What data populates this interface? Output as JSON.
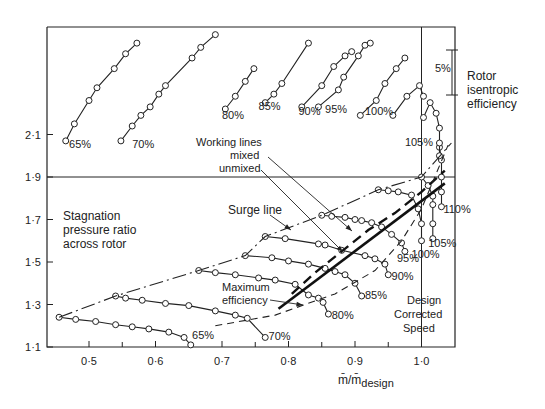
{
  "chart_data": {
    "type": "line",
    "title": "",
    "xlabel": "m̄/m̄design",
    "ylabel": "Stagnation pressure ratio across rotor",
    "secondary_ylabel": "Rotor isentropic efficiency",
    "efficiency_scale_label": "5%",
    "xlim": [
      0.44,
      1.055
    ],
    "ylim": [
      1.1,
      2.55
    ],
    "x_ticks": [
      0.5,
      0.6,
      0.7,
      0.8,
      0.9,
      1.0
    ],
    "x_tick_labels": [
      "0·5",
      "0·6",
      "0·7",
      "0·8",
      "0·9",
      "1·0"
    ],
    "y_ticks": [
      1.1,
      1.3,
      1.5,
      1.7,
      1.9,
      2.1
    ],
    "y_tick_labels": [
      "1·1",
      "1·3",
      "1·5",
      "1·7",
      "1·9",
      "2·1"
    ],
    "grid": false,
    "reference_lines": {
      "horizontal": 1.9,
      "vertical": 1.0
    },
    "annotations": [
      "Surge line",
      "Maximum efficiency",
      "Working lines",
      "mixed",
      "unmixed",
      "Design Corrected Speed"
    ],
    "pressure_ratio_series": [
      {
        "name": "65%",
        "x": [
          0.455,
          0.48,
          0.51,
          0.54,
          0.565,
          0.59,
          0.62,
          0.643,
          0.653
        ],
        "y": [
          1.24,
          1.23,
          1.22,
          1.205,
          1.195,
          1.185,
          1.17,
          1.145,
          1.11
        ]
      },
      {
        "name": "70%",
        "x": [
          0.54,
          0.555,
          0.58,
          0.615,
          0.65,
          0.69,
          0.72,
          0.738,
          0.765
        ],
        "y": [
          1.34,
          1.33,
          1.32,
          1.305,
          1.295,
          1.27,
          1.25,
          1.235,
          1.145
        ]
      },
      {
        "name": "80%",
        "x": [
          0.665,
          0.69,
          0.72,
          0.755,
          0.78,
          0.81,
          0.83,
          0.845,
          0.852,
          0.86
        ],
        "y": [
          1.46,
          1.45,
          1.44,
          1.425,
          1.415,
          1.395,
          1.345,
          1.33,
          1.31,
          1.255
        ]
      },
      {
        "name": "85%",
        "x": [
          0.735,
          0.775,
          0.8,
          0.83,
          0.855,
          0.87,
          0.885,
          0.9,
          0.91
        ],
        "y": [
          1.53,
          1.52,
          1.505,
          1.49,
          1.47,
          1.455,
          1.44,
          1.4,
          1.34
        ]
      },
      {
        "name": "90%",
        "x": [
          0.765,
          0.795,
          0.845,
          0.855,
          0.88,
          0.915,
          0.93,
          0.945,
          0.95
        ],
        "y": [
          1.62,
          1.61,
          1.585,
          1.58,
          1.555,
          1.53,
          1.515,
          1.49,
          1.44
        ]
      },
      {
        "name": "95%",
        "x": [
          0.85,
          0.865,
          0.885,
          0.9,
          0.91,
          0.925,
          0.94,
          0.955,
          0.97,
          0.975
        ],
        "y": [
          1.72,
          1.715,
          1.71,
          1.7,
          1.695,
          1.685,
          1.665,
          1.63,
          1.59,
          1.55
        ]
      },
      {
        "name": "100%",
        "x": [
          0.935,
          0.95,
          0.965,
          0.985,
          0.995,
          1.0,
          1.0
        ],
        "y": [
          1.84,
          1.835,
          1.83,
          1.815,
          1.75,
          1.68,
          1.6
        ]
      },
      {
        "name": "105%",
        "x": [
          1.0,
          1.01,
          1.017,
          1.017,
          1.017,
          1.017
        ],
        "y": [
          1.9,
          1.86,
          1.81,
          1.77,
          1.68,
          1.61
        ]
      },
      {
        "name": "110%",
        "x": [
          1.027,
          1.03,
          1.03,
          1.03,
          1.03
        ],
        "y": [
          2.04,
          1.98,
          1.9,
          1.83,
          1.76
        ]
      }
    ],
    "efficiency_series": [
      {
        "name": "65%",
        "x": [
          0.465,
          0.478,
          0.5,
          0.512,
          0.538,
          0.555,
          0.572
        ],
        "y": [
          2.07,
          2.15,
          2.26,
          2.32,
          2.41,
          2.48,
          2.53
        ]
      },
      {
        "name": "70%",
        "x": [
          0.548,
          0.565,
          0.578,
          0.592,
          0.605,
          0.615,
          0.655,
          0.668,
          0.69
        ],
        "y": [
          2.07,
          2.14,
          2.19,
          2.23,
          2.29,
          2.33,
          2.46,
          2.51,
          2.57
        ]
      },
      {
        "name": "80%",
        "x": [
          0.705,
          0.72,
          0.735,
          0.748
        ],
        "y": [
          2.22,
          2.28,
          2.35,
          2.41
        ]
      },
      {
        "name": "85%",
        "x": [
          0.765,
          0.778,
          0.79,
          0.83
        ],
        "y": [
          2.25,
          2.29,
          2.34,
          2.53
        ]
      },
      {
        "name": "90%",
        "x": [
          0.82,
          0.85,
          0.868,
          0.885,
          0.895
        ],
        "y": [
          2.23,
          2.33,
          2.42,
          2.47,
          2.49
        ]
      },
      {
        "name": "95%",
        "x": [
          0.845,
          0.875,
          0.883,
          0.905,
          0.915,
          0.923
        ],
        "y": [
          2.23,
          2.31,
          2.37,
          2.47,
          2.52,
          2.53
        ]
      },
      {
        "name": "100%",
        "x": [
          0.908,
          0.932,
          0.945,
          0.962,
          0.975
        ],
        "y": [
          2.19,
          2.26,
          2.34,
          2.41,
          2.46
        ]
      },
      {
        "name": "105%",
        "x": [
          0.957,
          0.978,
          0.997,
          1.003
        ],
        "y": [
          2.19,
          2.28,
          2.33,
          2.28
        ]
      },
      {
        "name": "110%",
        "x": [
          1.003,
          1.013,
          1.022,
          1.027,
          1.027,
          1.027
        ],
        "y": [
          2.18,
          2.25,
          2.2,
          2.13,
          2.06,
          2.0
        ]
      }
    ],
    "surge_line": {
      "x": [
        0.455,
        0.54,
        0.665,
        0.735,
        0.765,
        0.85,
        0.935,
        1.0,
        1.045
      ],
      "y": [
        1.24,
        1.34,
        1.46,
        1.53,
        1.62,
        1.72,
        1.84,
        1.9,
        2.06
      ]
    },
    "max_efficiency_line": {
      "x": [
        0.785,
        1.035
      ],
      "y": [
        1.28,
        1.87
      ]
    },
    "working_line_mixed": {
      "x": [
        0.805,
        0.84,
        0.88,
        0.92,
        0.96,
        1.0,
        1.035
      ],
      "y": [
        1.35,
        1.45,
        1.55,
        1.65,
        1.73,
        1.83,
        1.93
      ]
    },
    "working_line_unmixed": {
      "x": [
        0.69,
        0.78,
        0.87,
        0.93,
        0.97,
        1.0,
        1.04
      ],
      "y": [
        1.2,
        1.25,
        1.35,
        1.46,
        1.6,
        1.75,
        2.05
      ]
    }
  },
  "labels": {
    "stagnation": [
      "Stagnation",
      "pressure ratio",
      "across rotor"
    ],
    "rotor_eff": [
      "Rotor",
      "isentropic",
      "efficiency"
    ],
    "five_pct": "5%",
    "surge": "Surge line",
    "maxeff": [
      "Maximum",
      "efficiency"
    ],
    "working": [
      "Working lines",
      "mixed",
      "unmixed"
    ],
    "design": [
      "Design",
      "Corrected",
      "Speed"
    ],
    "xlabel_main": "m̄/m̄",
    "xlabel_sub": "design"
  }
}
